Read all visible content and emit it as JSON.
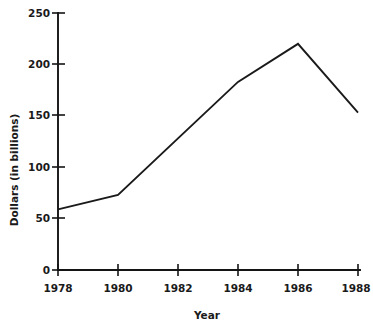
{
  "chart_data": {
    "type": "line",
    "title": "",
    "xlabel": "Year",
    "ylabel": "Dollars (in billions)",
    "x": [
      1978,
      1980,
      1982,
      1984,
      1986,
      1988
    ],
    "values": [
      59,
      73,
      128,
      183,
      220,
      153
    ],
    "series": [
      {
        "name": "Dollars (in billions)",
        "values": [
          59,
          73,
          128,
          183,
          220,
          153
        ]
      }
    ],
    "xlim": [
      1978,
      1988
    ],
    "ylim": [
      0,
      250
    ],
    "ytick_labels": [
      "0",
      "50",
      "100",
      "150",
      "200",
      "250"
    ],
    "ytick_values": [
      0,
      50,
      100,
      150,
      200,
      250
    ],
    "xtick_labels": [
      "1978",
      "1980",
      "1982",
      "1984",
      "1986",
      "1988"
    ],
    "xtick_values": [
      1978,
      1980,
      1982,
      1984,
      1986,
      1988
    ],
    "grid": false,
    "legend": false,
    "legend_position": "none",
    "line_color": "#1a1a1a",
    "axis_color": "#141414",
    "background_color": "#ffffff"
  },
  "axes": {
    "y_labels": {
      "t0": "0",
      "t1": "50",
      "t2": "100",
      "t3": "150",
      "t4": "200",
      "t5": "250"
    },
    "x_labels": {
      "t0": "1978",
      "t1": "1980",
      "t2": "1982",
      "t3": "1984",
      "t4": "1986",
      "t5": "1988"
    },
    "y_title": "Dollars (in billions)",
    "x_title": "Year"
  }
}
